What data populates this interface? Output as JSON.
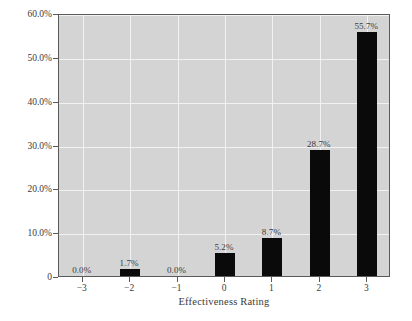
{
  "chart_data": {
    "type": "bar",
    "title": "",
    "xlabel": "Effectiveness Rating",
    "ylabel": "",
    "categories": [
      "-3",
      "-2",
      "-1",
      "0",
      "1",
      "2",
      "3"
    ],
    "values": [
      0.0,
      1.7,
      0.0,
      5.2,
      8.7,
      28.7,
      55.7
    ],
    "data_labels": [
      "0.0%",
      "1.7%",
      "0.0%",
      "5.2%",
      "8.7%",
      "28.7%",
      "55.7%"
    ],
    "ylim": [
      0,
      60
    ],
    "xlim": [
      -3.5,
      3.5
    ],
    "yticks": [
      0,
      10,
      20,
      30,
      40,
      50,
      60
    ],
    "ytick_labels": [
      "0",
      "10.0%",
      "20.0%",
      "30.0%",
      "40.0%",
      "50.0%",
      "60.0%"
    ],
    "xticks": [
      -3,
      -2,
      -1,
      0,
      1,
      2,
      3
    ],
    "xtick_labels": [
      "−3",
      "−2",
      "−1",
      "0",
      "1",
      "2",
      "3"
    ],
    "grid": true,
    "legend": null,
    "colors": {
      "bar": "#0a0a0a",
      "panel_background": "#d4d4d4",
      "gridline": "#f2f2f2",
      "axis": "#5a5a5a",
      "text": "#3b3b3b",
      "page_background": "#ffffff"
    }
  }
}
